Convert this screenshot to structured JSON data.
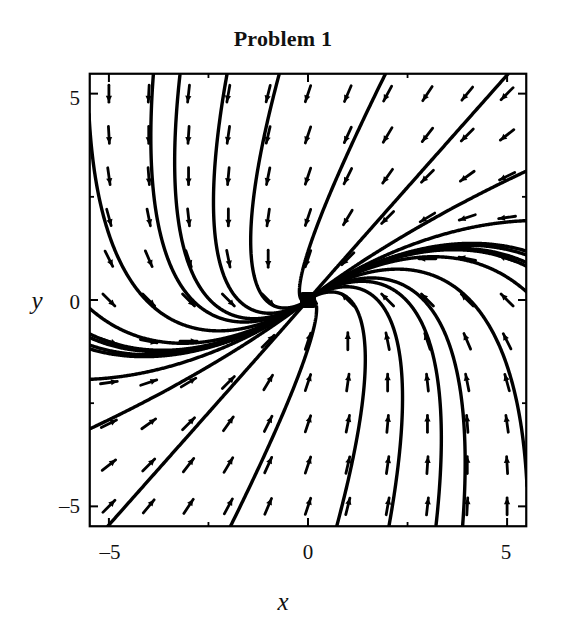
{
  "figure": {
    "title": "Problem 1",
    "background_color": "#ffffff",
    "ink_color": "#000000"
  },
  "chart_data": {
    "type": "line",
    "plot_kind": "phase-portrait-direction-field",
    "title": "Problem 1",
    "xlabel": "x",
    "ylabel": "y",
    "xlim": [
      -5.5,
      5.5
    ],
    "ylim": [
      -5.5,
      5.5
    ],
    "grid": false,
    "legend": null,
    "xticks": [
      -5,
      0,
      5
    ],
    "xticklabels": [
      "–5",
      "0",
      "5"
    ],
    "yticks": [
      -5,
      0,
      5
    ],
    "yticklabels": [
      "5",
      "0",
      "–5"
    ],
    "minor_xticks": [
      -2.5,
      2.5
    ],
    "minor_yticks": [
      -2.5,
      2.5
    ],
    "critical_point": {
      "x": 0,
      "y": 0,
      "kind": "stable improper node",
      "marker": "filled-square"
    },
    "system": {
      "dx": "-x - y",
      "dy": "x - 3*y",
      "eigenvalue": -2,
      "repeated": true,
      "stable": true
    },
    "trajectory_count": 18,
    "field_arrow_rows": 11,
    "field_arrow_cols": 11,
    "annotations": []
  },
  "axes": {
    "frame": {
      "left_px": 89,
      "top_px": 73,
      "right_px": 527,
      "bottom_px": 527
    },
    "x_tick_labels": [
      {
        "value": -5,
        "text": "–5"
      },
      {
        "value": 0,
        "text": "0"
      },
      {
        "value": 5,
        "text": "5"
      }
    ],
    "y_tick_labels": [
      {
        "value": 5,
        "text": "5"
      },
      {
        "value": 0,
        "text": "0"
      },
      {
        "value": -5,
        "text": "–5"
      }
    ],
    "x_axis_title": "x",
    "y_axis_title": "y"
  }
}
